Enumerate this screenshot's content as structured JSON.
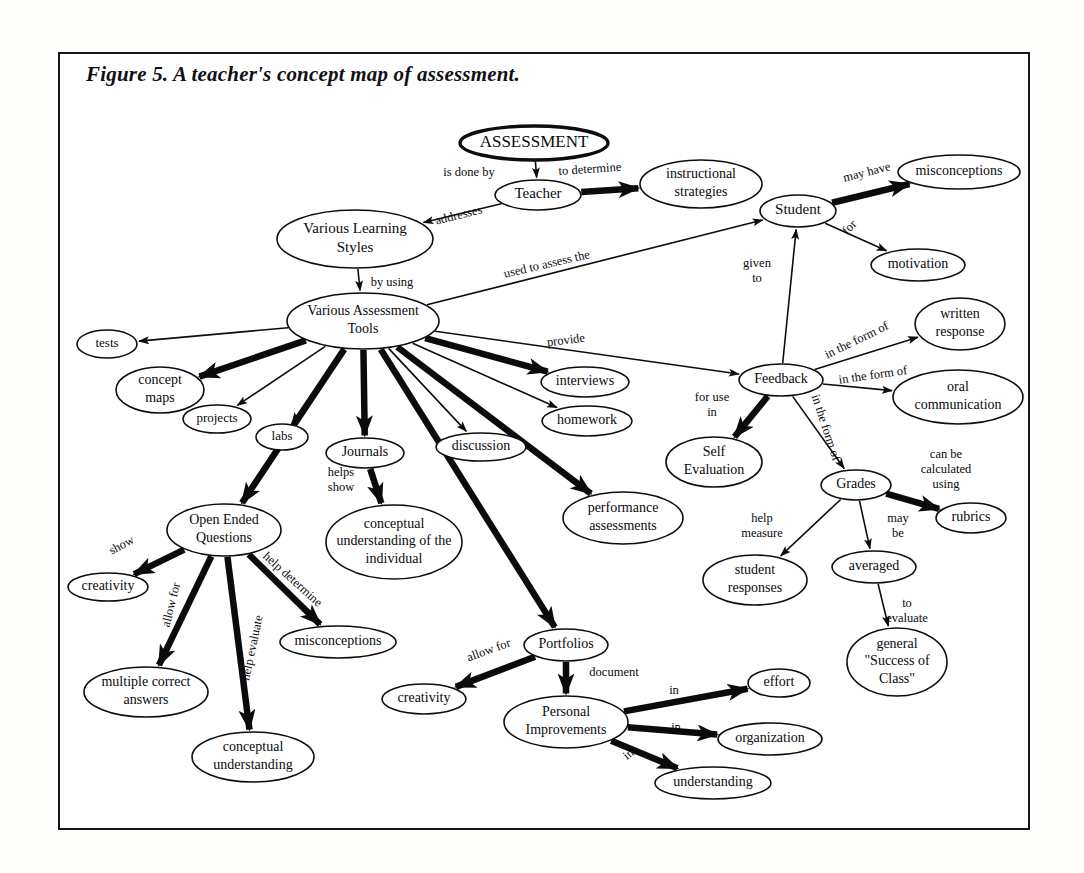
{
  "figure": {
    "title": "Figure 5. A teacher's concept map of assessment.",
    "border_color": "#16161a",
    "ink_color": "#0a0a0d",
    "background_color": "#ffffff"
  },
  "concept_map": {
    "type": "diagram",
    "layout": "concept-map",
    "root": "ASSESSMENT",
    "nodes": [
      {
        "id": "assessment",
        "label": "ASSESSMENT",
        "x": 534,
        "y": 143,
        "rx": 74,
        "ry": 17,
        "font_size": 17,
        "bold_outline": true,
        "lines": [
          "ASSESSMENT"
        ]
      },
      {
        "id": "teacher",
        "label": "Teacher",
        "x": 538,
        "y": 195,
        "rx": 43,
        "ry": 15,
        "font_size": 15,
        "lines": [
          "Teacher"
        ]
      },
      {
        "id": "instructional_strategies",
        "label": "instructional strategies",
        "x": 701,
        "y": 184,
        "rx": 61,
        "ry": 24,
        "font_size": 14,
        "lines": [
          "instructional",
          "strategies"
        ]
      },
      {
        "id": "various_learning_styles",
        "label": "Various Learning Styles",
        "x": 355,
        "y": 239,
        "rx": 78,
        "ry": 29,
        "font_size": 15,
        "lines": [
          "Various Learning",
          "Styles"
        ]
      },
      {
        "id": "various_assessment_tools",
        "label": "Various Assessment Tools",
        "x": 363,
        "y": 321,
        "rx": 76,
        "ry": 28,
        "font_size": 14,
        "lines": [
          "Various Assessment",
          "Tools"
        ]
      },
      {
        "id": "student",
        "label": "Student",
        "x": 798,
        "y": 211,
        "rx": 38,
        "ry": 16,
        "font_size": 15,
        "lines": [
          "Student"
        ]
      },
      {
        "id": "misconceptions_top",
        "label": "misconceptions",
        "x": 959,
        "y": 172,
        "rx": 61,
        "ry": 17,
        "font_size": 14,
        "lines": [
          "misconceptions"
        ]
      },
      {
        "id": "motivation",
        "label": "motivation",
        "x": 918,
        "y": 265,
        "rx": 47,
        "ry": 16,
        "font_size": 14,
        "lines": [
          "motivation"
        ]
      },
      {
        "id": "tests",
        "label": "tests",
        "x": 107,
        "y": 344,
        "rx": 30,
        "ry": 14,
        "font_size": 13,
        "lines": [
          "tests"
        ]
      },
      {
        "id": "concept_maps",
        "label": "concept maps",
        "x": 160,
        "y": 390,
        "rx": 44,
        "ry": 23,
        "font_size": 14,
        "lines": [
          "concept",
          "maps"
        ]
      },
      {
        "id": "projects",
        "label": "projects",
        "x": 217,
        "y": 419,
        "rx": 34,
        "ry": 14,
        "font_size": 13,
        "lines": [
          "projects"
        ]
      },
      {
        "id": "labs",
        "label": "labs",
        "x": 282,
        "y": 437,
        "rx": 26,
        "ry": 13,
        "font_size": 13,
        "lines": [
          "labs"
        ]
      },
      {
        "id": "journals",
        "label": "Journals",
        "x": 365,
        "y": 453,
        "rx": 39,
        "ry": 15,
        "font_size": 14,
        "lines": [
          "Journals"
        ]
      },
      {
        "id": "discussion",
        "label": "discussion",
        "x": 481,
        "y": 447,
        "rx": 45,
        "ry": 14,
        "font_size": 14,
        "lines": [
          "discussion"
        ]
      },
      {
        "id": "interviews",
        "label": "interviews",
        "x": 585,
        "y": 382,
        "rx": 44,
        "ry": 15,
        "font_size": 14,
        "lines": [
          "interviews"
        ]
      },
      {
        "id": "homework",
        "label": "homework",
        "x": 587,
        "y": 421,
        "rx": 45,
        "ry": 15,
        "font_size": 14,
        "lines": [
          "homework"
        ]
      },
      {
        "id": "performance_assessments",
        "label": "performance assessments",
        "x": 623,
        "y": 518,
        "rx": 60,
        "ry": 26,
        "font_size": 14,
        "lines": [
          "performance",
          "assessments"
        ]
      },
      {
        "id": "conceptual_understanding_individual",
        "label": "conceptual understanding of the individual",
        "x": 394,
        "y": 542,
        "rx": 68,
        "ry": 37,
        "font_size": 14,
        "lines": [
          "conceptual",
          "understanding of the",
          "individual"
        ]
      },
      {
        "id": "open_ended_questions",
        "label": "Open Ended Questions",
        "x": 224,
        "y": 530,
        "rx": 57,
        "ry": 26,
        "font_size": 14,
        "lines": [
          "Open Ended",
          "Questions"
        ]
      },
      {
        "id": "creativity_left",
        "label": "creativity",
        "x": 108,
        "y": 587,
        "rx": 40,
        "ry": 14,
        "font_size": 14,
        "lines": [
          "creativity"
        ]
      },
      {
        "id": "multiple_correct_answers",
        "label": "multiple correct answers",
        "x": 146,
        "y": 692,
        "rx": 62,
        "ry": 25,
        "font_size": 14,
        "lines": [
          "multiple correct",
          "answers"
        ]
      },
      {
        "id": "conceptual_understanding",
        "label": "conceptual understanding",
        "x": 253,
        "y": 757,
        "rx": 61,
        "ry": 25,
        "font_size": 14,
        "lines": [
          "conceptual",
          "understanding"
        ]
      },
      {
        "id": "misconceptions_oeq",
        "label": "misconceptions",
        "x": 338,
        "y": 642,
        "rx": 58,
        "ry": 16,
        "font_size": 14,
        "lines": [
          "misconceptions"
        ]
      },
      {
        "id": "portfolios",
        "label": "Portfolios",
        "x": 566,
        "y": 645,
        "rx": 42,
        "ry": 16,
        "font_size": 14,
        "lines": [
          "Portfolios"
        ]
      },
      {
        "id": "creativity_portfolio",
        "label": "creativity",
        "x": 424,
        "y": 699,
        "rx": 42,
        "ry": 15,
        "font_size": 14,
        "lines": [
          "creativity"
        ]
      },
      {
        "id": "personal_improvements",
        "label": "Personal Improvements",
        "x": 566,
        "y": 722,
        "rx": 62,
        "ry": 26,
        "font_size": 14,
        "lines": [
          "Personal",
          "Improvements"
        ]
      },
      {
        "id": "effort",
        "label": "effort",
        "x": 779,
        "y": 683,
        "rx": 31,
        "ry": 14,
        "font_size": 14,
        "lines": [
          "effort"
        ]
      },
      {
        "id": "organization",
        "label": "organization",
        "x": 770,
        "y": 739,
        "rx": 52,
        "ry": 16,
        "font_size": 14,
        "lines": [
          "organization"
        ]
      },
      {
        "id": "understanding",
        "label": "understanding",
        "x": 713,
        "y": 783,
        "rx": 58,
        "ry": 16,
        "font_size": 14,
        "lines": [
          "understanding"
        ]
      },
      {
        "id": "feedback",
        "label": "Feedback",
        "x": 781,
        "y": 380,
        "rx": 42,
        "ry": 16,
        "font_size": 14,
        "lines": [
          "Feedback"
        ]
      },
      {
        "id": "written_response",
        "label": "written response",
        "x": 960,
        "y": 324,
        "rx": 45,
        "ry": 26,
        "font_size": 14,
        "lines": [
          "written",
          "response"
        ]
      },
      {
        "id": "oral_communication",
        "label": "oral communication",
        "x": 958,
        "y": 397,
        "rx": 65,
        "ry": 27,
        "font_size": 14,
        "lines": [
          "oral",
          "communication"
        ]
      },
      {
        "id": "self_evaluation",
        "label": "Self Evaluation",
        "x": 714,
        "y": 462,
        "rx": 48,
        "ry": 25,
        "font_size": 14,
        "lines": [
          "Self",
          "Evaluation"
        ]
      },
      {
        "id": "grades",
        "label": "Grades",
        "x": 856,
        "y": 485,
        "rx": 35,
        "ry": 15,
        "font_size": 14,
        "lines": [
          "Grades"
        ]
      },
      {
        "id": "rubrics",
        "label": "rubrics",
        "x": 971,
        "y": 518,
        "rx": 35,
        "ry": 15,
        "font_size": 14,
        "lines": [
          "rubrics"
        ]
      },
      {
        "id": "student_responses",
        "label": "student responses",
        "x": 755,
        "y": 580,
        "rx": 52,
        "ry": 25,
        "font_size": 14,
        "lines": [
          "student",
          "responses"
        ]
      },
      {
        "id": "averaged",
        "label": "averaged",
        "x": 874,
        "y": 567,
        "rx": 42,
        "ry": 16,
        "font_size": 14,
        "lines": [
          "averaged"
        ]
      },
      {
        "id": "general_success_of_class",
        "label": "general \"Success of Class\"",
        "x": 897,
        "y": 662,
        "rx": 50,
        "ry": 34,
        "font_size": 14,
        "lines": [
          "general",
          "\"Success of",
          "Class\""
        ]
      }
    ],
    "edges": [
      {
        "from": "assessment",
        "to": "teacher",
        "label": "is done by",
        "label_x": 469,
        "label_y": 173,
        "label_rotate": 0,
        "weight": "thin"
      },
      {
        "from": "teacher",
        "to": "instructional_strategies",
        "label": "to determine",
        "label_x": 590,
        "label_y": 170,
        "label_rotate": -4,
        "weight": "thick"
      },
      {
        "from": "teacher",
        "to": "various_learning_styles",
        "label": "addresses",
        "label_x": 459,
        "label_y": 216,
        "label_rotate": -14,
        "weight": "thin"
      },
      {
        "from": "various_learning_styles",
        "to": "various_assessment_tools",
        "label": "by using",
        "label_x": 392,
        "label_y": 283,
        "label_rotate": 0,
        "weight": "thin"
      },
      {
        "from": "various_assessment_tools",
        "to": "student",
        "label": "used to assess the",
        "label_x": 547,
        "label_y": 265,
        "label_rotate": -13,
        "weight": "thin"
      },
      {
        "from": "student",
        "to": "misconceptions_top",
        "label": "may have",
        "label_x": 867,
        "label_y": 173,
        "label_rotate": -14,
        "weight": "thick"
      },
      {
        "from": "student",
        "to": "motivation",
        "label": "for",
        "label_x": 850,
        "label_y": 228,
        "label_rotate": -45,
        "weight": "thin"
      },
      {
        "from": "feedback",
        "to": "student",
        "label": "given to",
        "label_x": 757,
        "label_y": 272,
        "label_rotate": 0,
        "weight": "thin"
      },
      {
        "from": "various_assessment_tools",
        "to": "tests",
        "label": "",
        "weight": "thin"
      },
      {
        "from": "various_assessment_tools",
        "to": "concept_maps",
        "label": "",
        "weight": "thick"
      },
      {
        "from": "various_assessment_tools",
        "to": "projects",
        "label": "",
        "weight": "thin"
      },
      {
        "from": "various_assessment_tools",
        "to": "open_ended_questions",
        "label": "",
        "weight": "thick"
      },
      {
        "from": "various_assessment_tools",
        "to": "labs",
        "label": "",
        "weight": "thin"
      },
      {
        "from": "various_assessment_tools",
        "to": "journals",
        "label": "",
        "weight": "thick"
      },
      {
        "from": "various_assessment_tools",
        "to": "portfolios",
        "label": "",
        "weight": "thick"
      },
      {
        "from": "various_assessment_tools",
        "to": "discussion",
        "label": "",
        "weight": "thin"
      },
      {
        "from": "various_assessment_tools",
        "to": "performance_assessments",
        "label": "",
        "weight": "thick"
      },
      {
        "from": "various_assessment_tools",
        "to": "homework",
        "label": "",
        "weight": "thin"
      },
      {
        "from": "various_assessment_tools",
        "to": "interviews",
        "label": "",
        "weight": "thick"
      },
      {
        "from": "various_assessment_tools",
        "to": "feedback",
        "label": "provide",
        "label_x": 566,
        "label_y": 341,
        "label_rotate": -7,
        "weight": "thin"
      },
      {
        "from": "journals",
        "to": "conceptual_understanding_individual",
        "label": "helps show",
        "label_x": 341,
        "label_y": 481,
        "label_rotate": 0,
        "weight": "thick"
      },
      {
        "from": "open_ended_questions",
        "to": "creativity_left",
        "label": "show",
        "label_x": 122,
        "label_y": 546,
        "label_rotate": -28,
        "weight": "thick"
      },
      {
        "from": "open_ended_questions",
        "to": "multiple_correct_answers",
        "label": "allow for",
        "label_x": 172,
        "label_y": 605,
        "label_rotate": -76,
        "weight": "thick"
      },
      {
        "from": "open_ended_questions",
        "to": "conceptual_understanding",
        "label": "help evaluate",
        "label_x": 253,
        "label_y": 648,
        "label_rotate": -78,
        "weight": "thick"
      },
      {
        "from": "open_ended_questions",
        "to": "misconceptions_oeq",
        "label": "help determine",
        "label_x": 292,
        "label_y": 580,
        "label_rotate": 42,
        "weight": "thick"
      },
      {
        "from": "portfolios",
        "to": "creativity_portfolio",
        "label": "allow for",
        "label_x": 489,
        "label_y": 651,
        "label_rotate": -20,
        "weight": "thick"
      },
      {
        "from": "portfolios",
        "to": "personal_improvements",
        "label": "document",
        "label_x": 614,
        "label_y": 673,
        "label_rotate": 0,
        "weight": "thick"
      },
      {
        "from": "personal_improvements",
        "to": "effort",
        "label": "in",
        "label_x": 674,
        "label_y": 691,
        "label_rotate": 0,
        "weight": "thick"
      },
      {
        "from": "personal_improvements",
        "to": "organization",
        "label": "in",
        "label_x": 676,
        "label_y": 728,
        "label_rotate": 0,
        "weight": "thick"
      },
      {
        "from": "personal_improvements",
        "to": "understanding",
        "label": "in",
        "label_x": 629,
        "label_y": 755,
        "label_rotate": -38,
        "weight": "thick"
      },
      {
        "from": "feedback",
        "to": "written_response",
        "label": "in the form of",
        "label_x": 857,
        "label_y": 341,
        "label_rotate": -26,
        "weight": "thin"
      },
      {
        "from": "feedback",
        "to": "oral_communication",
        "label": "in the form of",
        "label_x": 873,
        "label_y": 376,
        "label_rotate": -8,
        "weight": "thin"
      },
      {
        "from": "feedback",
        "to": "self_evaluation",
        "label": "for use in",
        "label_x": 712,
        "label_y": 406,
        "label_rotate": 0,
        "weight": "thick"
      },
      {
        "from": "feedback",
        "to": "grades",
        "label": "in the form of",
        "label_x": 825,
        "label_y": 428,
        "label_rotate": 72,
        "weight": "thin"
      },
      {
        "from": "grades",
        "to": "rubrics",
        "label": "can be calculated using",
        "label_x": 946,
        "label_y": 470,
        "label_rotate": 0,
        "weight": "thick"
      },
      {
        "from": "grades",
        "to": "student_responses",
        "label": "help measure",
        "label_x": 762,
        "label_y": 527,
        "label_rotate": 0,
        "weight": "thin"
      },
      {
        "from": "grades",
        "to": "averaged",
        "label": "may be",
        "label_x": 898,
        "label_y": 527,
        "label_rotate": 0,
        "weight": "thin"
      },
      {
        "from": "averaged",
        "to": "general_success_of_class",
        "label": "to evaluate",
        "label_x": 907,
        "label_y": 612,
        "label_rotate": 0,
        "weight": "thin"
      }
    ],
    "edge_label_multiline": {
      "given to": [
        "given",
        "to"
      ],
      "helps show": [
        "helps",
        "show"
      ],
      "for use in": [
        "for use",
        "in"
      ],
      "can be calculated using": [
        "can be",
        "calculated",
        "using"
      ],
      "help measure": [
        "help",
        "measure"
      ],
      "may be": [
        "may",
        "be"
      ],
      "to evaluate": [
        "to",
        "evaluate"
      ]
    }
  }
}
